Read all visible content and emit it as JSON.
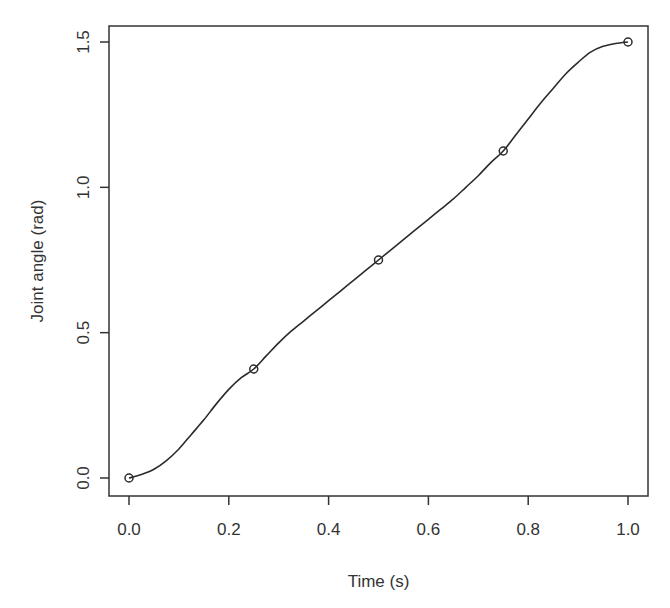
{
  "chart_data": {
    "type": "line",
    "title": "",
    "xlabel": "Time (s)",
    "ylabel": "Joint angle (rad)",
    "xlim": [
      0.0,
      1.0
    ],
    "ylim": [
      0.0,
      1.5
    ],
    "grid": false,
    "legend": null,
    "x_ticks": [
      "0.0",
      "0.2",
      "0.4",
      "0.6",
      "0.8",
      "1.0"
    ],
    "y_ticks": [
      "0.0",
      "0.5",
      "1.0",
      "1.5"
    ],
    "series": [
      {
        "name": "trajectory",
        "style": "smooth line",
        "x": [
          0.0,
          0.025,
          0.05,
          0.075,
          0.1,
          0.125,
          0.15,
          0.175,
          0.2,
          0.225,
          0.25,
          0.275,
          0.3,
          0.325,
          0.35,
          0.375,
          0.4,
          0.425,
          0.45,
          0.475,
          0.5,
          0.525,
          0.55,
          0.575,
          0.6,
          0.625,
          0.65,
          0.675,
          0.7,
          0.725,
          0.75,
          0.775,
          0.8,
          0.825,
          0.85,
          0.875,
          0.9,
          0.925,
          0.95,
          0.975,
          1.0
        ],
        "y": [
          0.0,
          0.012,
          0.03,
          0.06,
          0.1,
          0.15,
          0.2,
          0.255,
          0.305,
          0.345,
          0.375,
          0.42,
          0.465,
          0.505,
          0.54,
          0.575,
          0.61,
          0.645,
          0.68,
          0.715,
          0.75,
          0.785,
          0.82,
          0.855,
          0.89,
          0.925,
          0.96,
          1.0,
          1.04,
          1.085,
          1.125,
          1.18,
          1.235,
          1.29,
          1.34,
          1.39,
          1.43,
          1.465,
          1.485,
          1.495,
          1.5
        ]
      },
      {
        "name": "knots",
        "style": "open circle markers",
        "x": [
          0.0,
          0.25,
          0.5,
          0.75,
          1.0
        ],
        "y": [
          0.0,
          0.375,
          0.75,
          1.125,
          1.5
        ]
      }
    ]
  }
}
